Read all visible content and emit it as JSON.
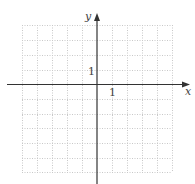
{
  "diagram": {
    "type": "coordinate-grid",
    "x_axis_label": "x",
    "y_axis_label": "y",
    "x_tick_label": "1",
    "y_tick_label": "1",
    "grid": {
      "x_min": -5,
      "x_max": 5,
      "y_min": -6,
      "y_max": 4,
      "step": 1,
      "style": "dotted"
    },
    "colors": {
      "grid": "#c8c8c8",
      "axis": "#333333",
      "label": "#444444"
    }
  }
}
